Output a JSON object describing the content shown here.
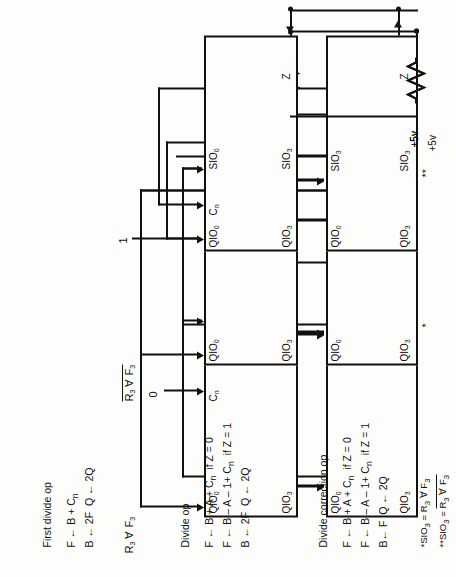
{
  "diagram": {
    "supply_label": "+5v",
    "ports": {
      "qio0": "QIO0",
      "qio3": "QIO3",
      "sio0": "SIO0",
      "sio3": "SIO3",
      "cn": "Cn",
      "z": "Z"
    },
    "columns": [
      {
        "id": "first-divide-op",
        "top_signal": "R3 ∀ F3",
        "top_signal_overline": false,
        "cn_input": "0",
        "marker": "*",
        "supply_label": "+5v",
        "caption": "First divide op",
        "equations": [
          "F ← B + C",
          "B ← 2F   Q ← 2Q"
        ],
        "equations_full": [
          "F ← B + Cn",
          "B ← 2F   Q ← 2Q"
        ],
        "upper_box_ports": [
          "QIO0",
          "Cn",
          "SIO0",
          "Z",
          "QIO3",
          "SIO3"
        ],
        "lower_box_ports": [
          "QIO0",
          "SIO0",
          "Z",
          "QIO3",
          "SIO3"
        ]
      },
      {
        "id": "divide-op",
        "top_signal": "R3 ∀ F3",
        "top_signal_overline": true,
        "cn_input": "",
        "marker": "**",
        "supply_label": "+5v",
        "caption": "Divide op",
        "equations": [
          "F ← B + A + Cn  if Z = 0",
          "F ← B – A – 1 + Cn  if Z = 1",
          "B ← 2F   Q ← 2Q"
        ],
        "upper_box_ports": [
          "QIO0",
          "Cn",
          "SIO0",
          "Z",
          "QIO3",
          "SIO3"
        ],
        "lower_box_ports": [
          "QIO0",
          "SIO0",
          "Z",
          "QIO3",
          "SIO3"
        ]
      },
      {
        "id": "divide-correction-op",
        "top_signal": "1",
        "top_signal_overline": false,
        "cn_input": "",
        "marker": "",
        "supply_label": "+5v",
        "caption": "Divide correction op",
        "equations": [
          "F ← B + A + Cn  if Z = 0",
          "F ← B – A – 1 + Cn  if Z = 1",
          "B ← F    Q ← 2Q"
        ],
        "upper_box_ports": [
          "QIO0",
          "Cn",
          "SIO0",
          "Z",
          "QIO3",
          "SIO3"
        ],
        "lower_box_ports": [
          "QIO0",
          "SIO3",
          "Z",
          "QIO3",
          "SIO3"
        ]
      }
    ],
    "footnotes": [
      "*SIO3 = R3 ∀ F3",
      "**SIO3 = R3 ∀ F3"
    ],
    "footnote_parts": [
      {
        "mark": "*",
        "lhs": "SIO3",
        "eq": "=",
        "rhs": "R3 ∀ F3",
        "overline": false
      },
      {
        "mark": "**",
        "lhs": "SIO3",
        "eq": "=",
        "rhs": "R3 ∀ F3",
        "overline": true
      }
    ],
    "colors": {
      "ink": "#111111",
      "paper": "#fdfdfc"
    }
  }
}
